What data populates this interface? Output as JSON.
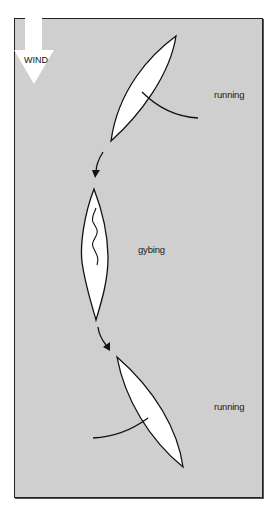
{
  "diagram": {
    "wind": {
      "label": "WIND",
      "direction": "down"
    },
    "stages": [
      {
        "label": "running",
        "position": "top"
      },
      {
        "label": "gybing",
        "position": "middle"
      },
      {
        "label": "running",
        "position": "bottom"
      }
    ],
    "colors": {
      "background": "#cfcfcf",
      "hull_fill": "#ffffff",
      "line": "#111111",
      "wind_arrow": "#ffffff"
    }
  }
}
